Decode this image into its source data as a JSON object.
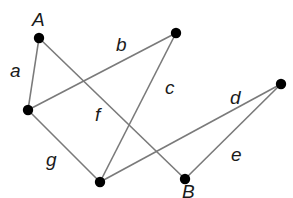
{
  "diagram": {
    "type": "graph",
    "edge_color": "#7a7a7a",
    "node_color": "#000000",
    "nodes": [
      {
        "id": "A",
        "label": "A",
        "x": 39,
        "y": 38,
        "label_x": 32,
        "label_y": 26
      },
      {
        "id": "T",
        "label": "",
        "x": 176,
        "y": 33
      },
      {
        "id": "R",
        "label": "",
        "x": 281,
        "y": 84
      },
      {
        "id": "L",
        "label": "",
        "x": 28,
        "y": 110
      },
      {
        "id": "M",
        "label": "",
        "x": 100,
        "y": 182
      },
      {
        "id": "B",
        "label": "B",
        "x": 185,
        "y": 179,
        "label_x": 182,
        "label_y": 198
      }
    ],
    "edges": [
      {
        "id": "a",
        "label": "a",
        "from": "A",
        "to": "L",
        "label_x": 10,
        "label_y": 77
      },
      {
        "id": "b",
        "label": "b",
        "from": "L",
        "to": "T",
        "label_x": 116,
        "label_y": 51
      },
      {
        "id": "f",
        "label": "f",
        "from": "A",
        "to": "B",
        "label_x": 95,
        "label_y": 121
      },
      {
        "id": "c",
        "label": "c",
        "from": "T",
        "to": "M",
        "label_x": 165,
        "label_y": 94
      },
      {
        "id": "d",
        "label": "d",
        "from": "M",
        "to": "R",
        "label_x": 230,
        "label_y": 104
      },
      {
        "id": "e",
        "label": "e",
        "from": "R",
        "to": "B",
        "label_x": 231,
        "label_y": 161
      },
      {
        "id": "g",
        "label": "g",
        "from": "L",
        "to": "M",
        "label_x": 46,
        "label_y": 166
      }
    ]
  }
}
